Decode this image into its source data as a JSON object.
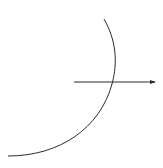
{
  "diagram": {
    "width": 163,
    "height": 168,
    "background": "#ffffff",
    "stroke_color": "#2b2b2b",
    "arc": {
      "description": "circular arc (lens/boundary surface)",
      "start": [
        104,
        19
      ],
      "end": [
        8,
        156
      ]
    },
    "ray": {
      "description": "horizontal arrow crossing the arc",
      "start": [
        74,
        82
      ],
      "end": [
        155,
        82
      ],
      "arrowhead": "right"
    }
  }
}
